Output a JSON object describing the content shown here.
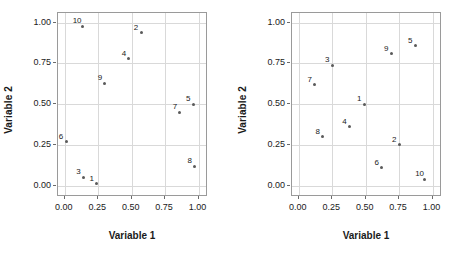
{
  "figure": {
    "background": "#ffffff",
    "grid_color": "#d9d9d9",
    "frame_color": "#9a9a9a",
    "text_color": "#1a1a1a",
    "point_color": "#5a5a5a"
  },
  "chart_data": [
    {
      "type": "scatter",
      "panel": "left",
      "title": "",
      "xlabel": "Variable 1",
      "ylabel": "Variable 2",
      "xlim": [
        -0.05,
        1.07
      ],
      "ylim": [
        -0.07,
        1.06
      ],
      "xticks": [
        0.0,
        0.25,
        0.5,
        0.75,
        1.0
      ],
      "xticklabels": [
        "0.00",
        "0.25",
        "0.50",
        "0.75",
        "1.00"
      ],
      "yticks": [
        0.0,
        0.25,
        0.5,
        0.75,
        1.0
      ],
      "yticklabels": [
        "0.00",
        "0.25",
        "0.50",
        "0.75",
        "1.00"
      ],
      "grid": true,
      "legend": "none",
      "point_labels": [
        "1",
        "2",
        "3",
        "4",
        "5",
        "6",
        "7",
        "8",
        "9",
        "10"
      ],
      "points": [
        {
          "label": "1",
          "x": 0.24,
          "y": 0.01
        },
        {
          "label": "2",
          "x": 0.57,
          "y": 0.94
        },
        {
          "label": "3",
          "x": 0.14,
          "y": 0.05
        },
        {
          "label": "4",
          "x": 0.48,
          "y": 0.78
        },
        {
          "label": "5",
          "x": 0.96,
          "y": 0.5
        },
        {
          "label": "6",
          "x": 0.01,
          "y": 0.27
        },
        {
          "label": "7",
          "x": 0.86,
          "y": 0.45
        },
        {
          "label": "8",
          "x": 0.97,
          "y": 0.12
        },
        {
          "label": "9",
          "x": 0.3,
          "y": 0.63
        },
        {
          "label": "10",
          "x": 0.13,
          "y": 0.98
        }
      ]
    },
    {
      "type": "scatter",
      "panel": "right",
      "title": "",
      "xlabel": "Variable 1",
      "ylabel": "Variable 2",
      "xlim": [
        -0.05,
        1.07
      ],
      "ylim": [
        -0.07,
        1.06
      ],
      "xticks": [
        0.0,
        0.25,
        0.5,
        0.75,
        1.0
      ],
      "xticklabels": [
        "0.00",
        "0.25",
        "0.50",
        "0.75",
        "1.00"
      ],
      "yticks": [
        0.0,
        0.25,
        0.5,
        0.75,
        1.0
      ],
      "yticklabels": [
        "0.00",
        "0.25",
        "0.50",
        "0.75",
        "1.00"
      ],
      "grid": true,
      "legend": "none",
      "point_labels": [
        "1",
        "2",
        "3",
        "4",
        "5",
        "6",
        "7",
        "8",
        "9",
        "10"
      ],
      "points": [
        {
          "label": "1",
          "x": 0.49,
          "y": 0.5
        },
        {
          "label": "2",
          "x": 0.75,
          "y": 0.25
        },
        {
          "label": "3",
          "x": 0.25,
          "y": 0.74
        },
        {
          "label": "4",
          "x": 0.38,
          "y": 0.36
        },
        {
          "label": "5",
          "x": 0.87,
          "y": 0.86
        },
        {
          "label": "6",
          "x": 0.62,
          "y": 0.11
        },
        {
          "label": "7",
          "x": 0.12,
          "y": 0.62
        },
        {
          "label": "8",
          "x": 0.18,
          "y": 0.3
        },
        {
          "label": "9",
          "x": 0.69,
          "y": 0.81
        },
        {
          "label": "10",
          "x": 0.94,
          "y": 0.04
        }
      ]
    }
  ]
}
